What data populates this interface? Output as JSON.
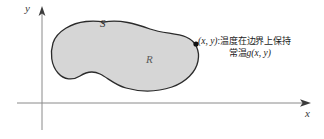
{
  "figure": {
    "background_color": "#ffffff",
    "axes": {
      "x_label": "x",
      "y_label": "y",
      "axis_color": "#808080",
      "arrow_color": "#3c3c3c",
      "origin": {
        "x": 42,
        "y": 103
      },
      "x_axis_from": 17,
      "x_axis_to": 310,
      "y_axis_from": 130,
      "y_axis_to": 8
    },
    "region": {
      "boundary_label": "S",
      "interior_label": "R",
      "fill_color": "#d6d6d6",
      "stroke_color": "#2b2b2b"
    },
    "boundary_point": {
      "dot_color": "#111111",
      "point_label": "(x, y)",
      "separator": ":",
      "annotation_line1_cjk": "温度在边界上保持",
      "annotation_line2_cjk": "常温",
      "annotation_line2_func": "g(x, y)"
    }
  }
}
